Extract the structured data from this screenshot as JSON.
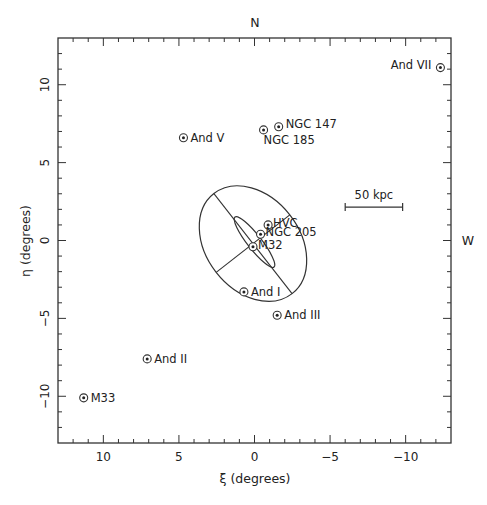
{
  "chart_data": {
    "type": "scatter",
    "title": "",
    "xlabel": "ξ (degrees)",
    "ylabel": "η (degrees)",
    "xlim": [
      13,
      -13
    ],
    "ylim": [
      -13,
      13
    ],
    "x_inverted": true,
    "grid": false,
    "legend": null,
    "xticks": [
      10,
      5,
      0,
      -5,
      -10
    ],
    "xtick_labels": [
      "10",
      "5",
      "0",
      "−5",
      "−10"
    ],
    "yticks": [
      10,
      5,
      0,
      -5,
      -10
    ],
    "ytick_labels": [
      "10",
      "5",
      "0",
      "−5",
      "−10"
    ],
    "x_minor_step": 1,
    "y_minor_step": 1,
    "compass_labels": {
      "north": "N",
      "west": "W"
    },
    "marker": "circle-dot",
    "points": [
      {
        "name": "And VII",
        "x": -12.3,
        "y": 11.1,
        "label_side": "left"
      },
      {
        "name": "NGC 147",
        "x": -1.6,
        "y": 7.3,
        "label_side": "right"
      },
      {
        "name": "NGC 185",
        "x": -0.6,
        "y": 7.1,
        "label_side": "below-right"
      },
      {
        "name": "And V",
        "x": 4.7,
        "y": 6.6,
        "label_side": "right"
      },
      {
        "name": "HVC",
        "x": -0.9,
        "y": 1.0,
        "label_side": "right"
      },
      {
        "name": "NGC 205",
        "x": -0.4,
        "y": 0.4,
        "label_side": "right"
      },
      {
        "name": "M32",
        "x": 0.1,
        "y": -0.4,
        "label_side": "right"
      },
      {
        "name": "And I",
        "x": 0.7,
        "y": -3.3,
        "label_side": "right"
      },
      {
        "name": "And III",
        "x": -1.5,
        "y": -4.8,
        "label_side": "right"
      },
      {
        "name": "And II",
        "x": 7.1,
        "y": -7.6,
        "label_side": "right"
      },
      {
        "name": "M33",
        "x": 11.3,
        "y": -10.1,
        "label_side": "right"
      }
    ],
    "annotations": [
      {
        "type": "ellipse",
        "description": "outer ellipse with major and minor axes drawn",
        "center": [
          0.1,
          -0.2
        ],
        "semi_major_deg": 4.2,
        "semi_minor_deg": 3.0,
        "position_angle_deg_from_horizontal": 52,
        "draw_axes": true
      },
      {
        "type": "ellipse",
        "description": "inner narrow ellipse (M31 disk)",
        "center": [
          0.0,
          -0.1
        ],
        "semi_major_deg": 2.1,
        "semi_minor_deg": 0.45,
        "position_angle_deg_from_horizontal": 52,
        "draw_axes": false
      },
      {
        "type": "scale_bar",
        "label": "50 kpc",
        "x_start": -6.0,
        "x_end": -9.8,
        "y": 2.4
      }
    ]
  }
}
